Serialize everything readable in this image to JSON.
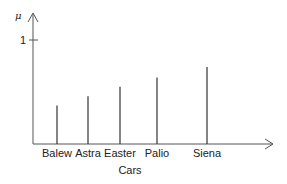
{
  "chart_data": {
    "type": "bar",
    "title": "",
    "xlabel": "Cars",
    "ylabel": "μ",
    "categories": [
      "Balew",
      "Astra",
      "Easter",
      "Palio",
      "Siena"
    ],
    "values": [
      0.37,
      0.46,
      0.55,
      0.64,
      0.74
    ],
    "yticks": [
      {
        "value": 1,
        "label": "1"
      }
    ],
    "ylim": [
      0,
      1.2
    ],
    "grid": false,
    "legend": null,
    "bar_style": "stem lines"
  },
  "colors": {
    "axis": "#444444",
    "bar": "#333333",
    "text": "#222222"
  }
}
